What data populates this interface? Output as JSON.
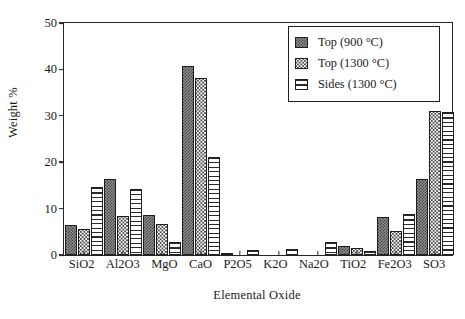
{
  "chart_data": {
    "type": "bar",
    "title": "",
    "xlabel": "Elemental Oxide",
    "ylabel": "Weight %",
    "ylim": [
      0,
      50
    ],
    "yticks": [
      0,
      10,
      20,
      30,
      40,
      50
    ],
    "grid": false,
    "legend_position": "top-right",
    "categories": [
      "SiO2",
      "Al2O3",
      "MgO",
      "CaO",
      "P2O5",
      "K2O",
      "Na2O",
      "TiO2",
      "Fe2O3",
      "SO3"
    ],
    "series": [
      {
        "name": "Top (900 °C)",
        "pattern": "dark-checker",
        "values": [
          6.4,
          16.3,
          8.6,
          40.8,
          0.3,
          0.0,
          0.0,
          2.0,
          8.2,
          16.4
        ]
      },
      {
        "name": "Top (1300 °C)",
        "pattern": "dotted",
        "values": [
          5.7,
          8.4,
          6.7,
          38.1,
          0.0,
          0.0,
          0.0,
          1.6,
          5.2,
          31.0
        ]
      },
      {
        "name": "Sides (1300 °C)",
        "pattern": "horizontal-lines",
        "values": [
          14.6,
          14.2,
          2.9,
          21.1,
          1.0,
          1.4,
          2.7,
          0.9,
          8.8,
          30.9
        ]
      }
    ]
  },
  "legend": {
    "items": [
      {
        "label": "Top (900 °C)"
      },
      {
        "label": "Top (1300 °C)"
      },
      {
        "label": "Sides (1300 °C)"
      }
    ]
  },
  "axes": {
    "y_title": "Weight %",
    "x_title": "Elemental Oxide",
    "y_ticks": [
      "50",
      "40",
      "30",
      "20",
      "10",
      "0"
    ],
    "x_ticks": [
      "SiO2",
      "Al2O3",
      "MgO",
      "CaO",
      "P2O5",
      "K2O",
      "Na2O",
      "TiO2",
      "Fe2O3",
      "SO3"
    ]
  },
  "colors": {
    "axis": "#262626",
    "bar_outline": "#1f1f1f",
    "series_dark": "#8a8a8a",
    "series_dotted": "#ffffff",
    "series_lined": "#ffffff",
    "background": "#ffffff"
  }
}
